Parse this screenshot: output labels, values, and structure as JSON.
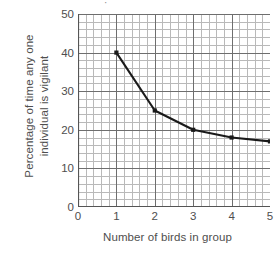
{
  "chart_data": {
    "type": "line",
    "title": "",
    "xlabel": "Number of birds in group",
    "ylabel_line1": "Percentage of time any one",
    "ylabel_line2": "individual is vigilant",
    "x": [
      1,
      2,
      3,
      4,
      5
    ],
    "values": [
      40,
      25,
      20,
      18,
      17
    ],
    "series": [
      {
        "name": "Percentage of time any one individual is vigilant",
        "x": [
          1,
          2,
          3,
          4,
          5
        ],
        "values": [
          40,
          25,
          20,
          18,
          17
        ]
      }
    ],
    "xticks": [
      "0",
      "1",
      "2",
      "3",
      "4",
      "5"
    ],
    "xtick_values": [
      0,
      1,
      2,
      3,
      4,
      5
    ],
    "yticks": [
      "0",
      "10",
      "20",
      "30",
      "40",
      "50"
    ],
    "ytick_values": [
      0,
      10,
      20,
      30,
      40,
      50
    ],
    "xlim": [
      0,
      5
    ],
    "ylim": [
      0,
      50
    ],
    "grid": true,
    "grid_minor": true,
    "grid_minor_step_x": 0.2,
    "grid_minor_step_y": 2,
    "legend": "none",
    "marker": "square",
    "line_color": "#1a1a1a",
    "grid_major_color": "#6e6e6e",
    "grid_minor_color": "#b9b9b9",
    "axis_color": "#555555",
    "text_color": "#4e4e4e",
    "background": "#ffffff"
  },
  "artifact": {
    "top_glyph": "·"
  }
}
